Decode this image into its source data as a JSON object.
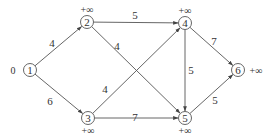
{
  "diagram": {
    "type": "directed weighted graph",
    "colors": {
      "line": "#555555",
      "text": "#333333",
      "background": "#ffffff"
    },
    "nodes": [
      {
        "id": "1",
        "label": "1",
        "x": 30,
        "y": 70,
        "dist": "0",
        "dist_x": 13,
        "dist_y": 74
      },
      {
        "id": "2",
        "label": "2",
        "x": 87,
        "y": 22,
        "dist": "+∞",
        "dist_x": 87,
        "dist_y": 13
      },
      {
        "id": "3",
        "label": "3",
        "x": 88,
        "y": 118,
        "dist": "+∞",
        "dist_x": 88,
        "dist_y": 134
      },
      {
        "id": "4",
        "label": "4",
        "x": 185,
        "y": 23,
        "dist": "+∞",
        "dist_x": 185,
        "dist_y": 14
      },
      {
        "id": "5",
        "label": "5",
        "x": 185,
        "y": 118,
        "dist": "+∞",
        "dist_x": 185,
        "dist_y": 134
      },
      {
        "id": "6",
        "label": "6",
        "x": 238,
        "y": 70,
        "dist": "+∞",
        "dist_x": 256,
        "dist_y": 74
      }
    ],
    "edges": [
      {
        "from": "1",
        "to": "2",
        "weight": "4",
        "lx": 52,
        "ly": 47
      },
      {
        "from": "1",
        "to": "3",
        "weight": "6",
        "lx": 50,
        "ly": 105
      },
      {
        "from": "2",
        "to": "4",
        "weight": "5",
        "lx": 135,
        "ly": 19
      },
      {
        "from": "2",
        "to": "5",
        "weight": "4",
        "lx": 117,
        "ly": 50
      },
      {
        "from": "3",
        "to": "4",
        "weight": "4",
        "lx": 105,
        "ly": 93
      },
      {
        "from": "3",
        "to": "5",
        "weight": "7",
        "lx": 135,
        "ly": 121
      },
      {
        "from": "4",
        "to": "5",
        "weight": "5",
        "lx": 191,
        "ly": 74
      },
      {
        "from": "4",
        "to": "6",
        "weight": "7",
        "lx": 214,
        "ly": 45
      },
      {
        "from": "5",
        "to": "6",
        "weight": "5",
        "lx": 215,
        "ly": 104
      }
    ]
  }
}
